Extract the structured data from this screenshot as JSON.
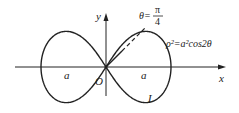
{
  "figure": {
    "curve_equation": "ρ²=a²cos2θ",
    "curve_name": "L",
    "axis_x_label": "x",
    "axis_y_label": "y",
    "origin_label": "O",
    "left_a_label": "a",
    "right_a_label": "a",
    "angle_label_left": "θ=",
    "angle_num": "π",
    "angle_den": "4"
  },
  "colors": {
    "stroke": "#222222",
    "background": "#ffffff"
  }
}
